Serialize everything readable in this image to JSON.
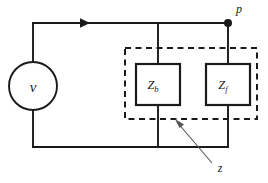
{
  "diagram": {
    "background_color": "#ffffff",
    "line_color": "#1a1a1a",
    "leader_color": "#555555",
    "source": {
      "type": "voltage-source",
      "label": "v",
      "shape": "circle"
    },
    "node": {
      "label": "p",
      "marker": "filled-dot"
    },
    "current_arrow": {
      "direction": "right",
      "on": "top-wire"
    },
    "group": {
      "label": "z",
      "style": "dashed-box",
      "leader": "arrow"
    },
    "components": [
      {
        "name": "impedance-zb",
        "symbol": "Z",
        "subscript": "b"
      },
      {
        "name": "impedance-zf",
        "symbol": "Z",
        "subscript": "f"
      }
    ]
  }
}
